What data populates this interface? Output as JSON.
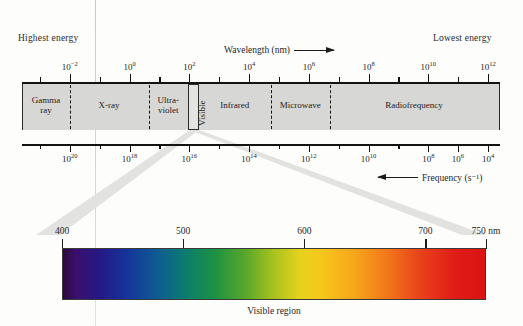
{
  "figure": {
    "corner_left_label": "Highest energy",
    "corner_right_label": "Lowest energy",
    "wavelength_caption": "Wavelength (nm)",
    "frequency_caption": "Frequency (s⁻¹)",
    "visible_region_caption": "Visible region"
  },
  "chart_data": {
    "type": "bar",
    "xlabel": "Wavelength (nm)",
    "ylabel": "",
    "secondary_xlabel": "Frequency (s⁻¹)",
    "grid": false,
    "legend_position": "none",
    "annotations": [
      "Highest energy",
      "Lowest energy",
      "Visible region"
    ],
    "top_axis": {
      "name": "Wavelength (nm)",
      "direction": "increasing to the right",
      "range_exponents": [
        -3,
        13
      ],
      "tick_exponents": [
        -2,
        -1,
        0,
        1,
        2,
        3,
        4,
        5,
        6,
        7,
        8,
        9,
        10,
        11,
        12
      ],
      "labeled_ticks": [
        {
          "exponent": -2,
          "text": "10⁻²",
          "x_pct": 10.0
        },
        {
          "exponent": 0,
          "text": "10⁰",
          "x_pct": 22.5
        },
        {
          "exponent": 2,
          "text": "10²",
          "x_pct": 35.0
        },
        {
          "exponent": 4,
          "text": "10⁴",
          "x_pct": 47.5
        },
        {
          "exponent": 6,
          "text": "10⁶",
          "x_pct": 60.0
        },
        {
          "exponent": 8,
          "text": "10⁸",
          "x_pct": 72.5
        },
        {
          "exponent": 10,
          "text": "10¹⁰",
          "x_pct": 85.0
        },
        {
          "exponent": 12,
          "text": "10¹²",
          "x_pct": 97.5
        }
      ]
    },
    "bottom_axis": {
      "name": "Frequency (s⁻¹)",
      "direction": "decreasing to the right",
      "range_exponents": [
        21,
        3
      ],
      "labeled_ticks": [
        {
          "exponent": 20,
          "text": "10²⁰",
          "x_pct": 10.0
        },
        {
          "exponent": 18,
          "text": "10¹⁸",
          "x_pct": 22.5
        },
        {
          "exponent": 16,
          "text": "10¹⁶",
          "x_pct": 35.0
        },
        {
          "exponent": 14,
          "text": "10¹⁴",
          "x_pct": 47.5
        },
        {
          "exponent": 12,
          "text": "10¹²",
          "x_pct": 60.0
        },
        {
          "exponent": 10,
          "text": "10¹⁰",
          "x_pct": 72.5
        },
        {
          "exponent": 8,
          "text": "10⁸",
          "x_pct": 85.0
        },
        {
          "exponent": 6,
          "text": "10⁶",
          "x_pct": 91.2
        },
        {
          "exponent": 4,
          "text": "10⁴",
          "x_pct": 97.5
        }
      ]
    },
    "bands": [
      {
        "label": "Gamma\nray",
        "start_pct": 0.0,
        "end_pct": 10.0,
        "center_pct": 5.0
      },
      {
        "label": "X-ray",
        "start_pct": 10.0,
        "end_pct": 26.5,
        "center_pct": 18.2
      },
      {
        "label": "Ultra-\nviolet",
        "start_pct": 26.5,
        "end_pct": 34.8,
        "center_pct": 30.6
      },
      {
        "label": "Visible",
        "start_pct": 34.8,
        "end_pct": 37.0,
        "center_pct": 35.9,
        "orientation": "vertical",
        "boxed": true
      },
      {
        "label": "Infrared",
        "start_pct": 37.0,
        "end_pct": 52.0,
        "center_pct": 44.5
      },
      {
        "label": "Microwave",
        "start_pct": 52.0,
        "end_pct": 64.5,
        "center_pct": 58.2
      },
      {
        "label": "Radiofrequency",
        "start_pct": 64.5,
        "end_pct": 100.0,
        "center_pct": 82.0
      }
    ],
    "visible_detail": {
      "unit": "nm",
      "range": [
        400,
        750
      ],
      "tick_values": [
        400,
        500,
        600,
        700,
        750
      ],
      "tick_labels": [
        "400",
        "500",
        "600",
        "700",
        "750 nm"
      ],
      "colors": [
        {
          "wavelength": 400,
          "hex": "#2d0a3a",
          "name": "violet"
        },
        {
          "wavelength": 430,
          "hex": "#241a86",
          "name": "indigo"
        },
        {
          "wavelength": 470,
          "hex": "#0e5a93",
          "name": "blue"
        },
        {
          "wavelength": 500,
          "hex": "#0b7d6f",
          "name": "cyan-green"
        },
        {
          "wavelength": 530,
          "hex": "#1d9242",
          "name": "green"
        },
        {
          "wavelength": 570,
          "hex": "#e6d21c",
          "name": "yellow"
        },
        {
          "wavelength": 610,
          "hex": "#f7a61b",
          "name": "orange"
        },
        {
          "wavelength": 660,
          "hex": "#e8401a",
          "name": "red-orange"
        },
        {
          "wavelength": 750,
          "hex": "#dc1411",
          "name": "red"
        }
      ]
    }
  }
}
